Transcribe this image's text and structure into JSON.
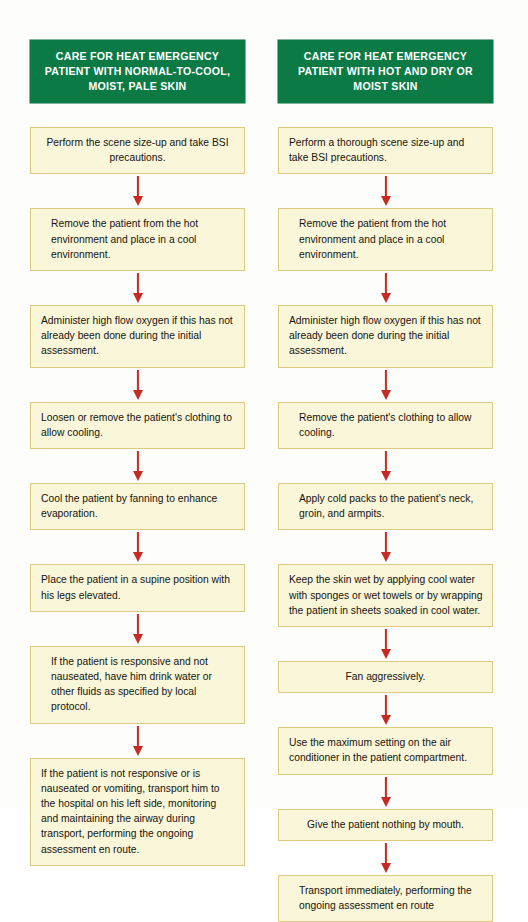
{
  "colors": {
    "header_green": "#0C7A45",
    "box_fill": "#FAF6D9",
    "box_border": "#DCCB7E",
    "arrow_red": "#C62B23",
    "text": "#17140F",
    "header_text": "#FFFFFF"
  },
  "columns": [
    {
      "header": "CARE FOR HEAT EMERGENCY PATIENT WITH NORMAL-TO-COOL, MOIST, PALE SKIN",
      "steps": [
        {
          "text": "Perform the scene size-up and take BSI precautions.",
          "align": "center"
        },
        {
          "text": "Remove the patient from the hot environment and place in a cool environment.",
          "align": "indent"
        },
        {
          "text": "Administer high flow oxygen if this has not already been done during the initial assessment.",
          "align": "left"
        },
        {
          "text": "Loosen or remove the patient's clothing to allow cooling.",
          "align": "left"
        },
        {
          "text": "Cool the patient by fanning to enhance evaporation.",
          "align": "left"
        },
        {
          "text": "Place the patient in a supine position with his legs elevated.",
          "align": "left"
        },
        {
          "text": "If the patient is responsive and not nauseated, have him drink water or other fluids as specified by local protocol.",
          "align": "indent"
        },
        {
          "text": "If the patient is not responsive or is nauseated or vomiting, transport him to the hospital on his left side, monitoring and maintaining the airway during transport, performing the ongoing assessment en route.",
          "align": "left"
        }
      ]
    },
    {
      "header": "CARE FOR HEAT EMERGENCY PATIENT WITH HOT AND DRY OR MOIST SKIN",
      "steps": [
        {
          "text": "Perform a thorough scene size-up and take BSI precautions.",
          "align": "left"
        },
        {
          "text": "Remove the patient from the hot environment and place in a cool environment.",
          "align": "indent"
        },
        {
          "text": "Administer high flow oxygen if this has not already been done during the initial assessment.",
          "align": "left"
        },
        {
          "text": "Remove the patient's clothing to allow cooling.",
          "align": "indent"
        },
        {
          "text": "Apply cold packs to the patient's neck, groin, and armpits.",
          "align": "indent"
        },
        {
          "text": "Keep the skin wet by applying cool water with sponges or wet towels or by wrapping the patient in sheets soaked in cool water.",
          "align": "left"
        },
        {
          "text": "Fan aggressively.",
          "align": "center"
        },
        {
          "text": "Use the maximum setting on the air conditioner in the patient compartment.",
          "align": "left"
        },
        {
          "text": "Give the patient nothing by mouth.",
          "align": "center"
        },
        {
          "text": "Transport immediately, performing the ongoing assessment en route",
          "align": "indent"
        }
      ]
    }
  ]
}
